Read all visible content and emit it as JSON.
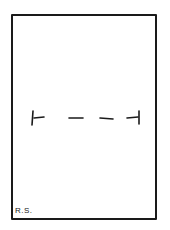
{
  "drawing": {
    "type": "hand-drawn rectangle with dashed horizontal line",
    "initials": "R.S.",
    "stroke_color": "#1a1a1a",
    "background": "#ffffff"
  }
}
